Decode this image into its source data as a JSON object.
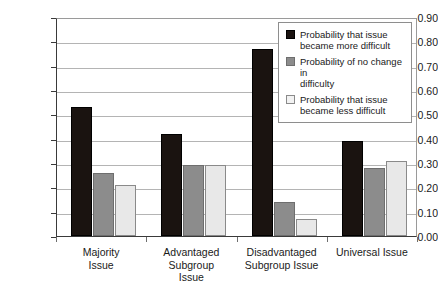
{
  "chart_data": {
    "type": "bar",
    "title": "",
    "xlabel": "",
    "ylabel": "",
    "ylim": [
      0.0,
      0.9
    ],
    "ytick_labels": [
      "0.00",
      "0.10",
      "0.20",
      "0.30",
      "0.40",
      "0.50",
      "0.60",
      "0.70",
      "0.80",
      "0.90"
    ],
    "ytick_values": [
      0.0,
      0.1,
      0.2,
      0.3,
      0.4,
      0.5,
      0.6,
      0.7,
      0.8,
      0.9
    ],
    "grid": true,
    "legend_position": "top-right",
    "categories": [
      "Majority Issue",
      "Advantaged Subgroup Issue",
      "Disadvantaged Subgroup Issue",
      "Universal Issue"
    ],
    "category_lines": [
      [
        "Majority",
        "Issue"
      ],
      [
        "Advantaged",
        "Subgroup",
        "Issue"
      ],
      [
        "Disadvantaged",
        "Subgroup Issue"
      ],
      [
        "Universal Issue"
      ]
    ],
    "series": [
      {
        "name": "Probability that issue became more difficult",
        "name_lines": [
          "Probability that issue",
          "became more difficult"
        ],
        "color": "#1a1310",
        "values": [
          0.53,
          0.42,
          0.77,
          0.39
        ]
      },
      {
        "name": "Probability of no change in difficulty",
        "name_lines": [
          "Probability of no change in",
          "difficulty"
        ],
        "color": "#8c8c8c",
        "values": [
          0.26,
          0.29,
          0.14,
          0.28
        ]
      },
      {
        "name": "Probability that issue became less difficult",
        "name_lines": [
          "Probability that issue",
          "became less difficult"
        ],
        "color": "#f2f2f2",
        "values": [
          0.21,
          0.29,
          0.07,
          0.31
        ]
      }
    ]
  }
}
